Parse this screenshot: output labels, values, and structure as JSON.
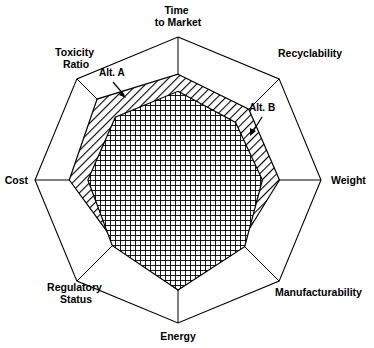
{
  "chart_data": {
    "type": "radar",
    "title": "",
    "subtitle": "",
    "xlabel": "",
    "ylabel": "",
    "grid": true,
    "legend_position": "inline-annotation",
    "axis_max": 1.0,
    "axis_min": 0.0,
    "categories": [
      "Time to Market",
      "Recyclability",
      "Weight",
      "Manufacturability",
      "Energy",
      "Regulatory Status",
      "Cost",
      "Toxicity Ratio"
    ],
    "series": [
      {
        "name": "Alt. A",
        "pattern": "diagonal-hatch",
        "values": [
          0.74,
          0.7,
          0.71,
          0.62,
          0.77,
          0.62,
          0.76,
          0.8
        ]
      },
      {
        "name": "Alt. B",
        "pattern": "cross-hatch",
        "values": [
          0.62,
          0.57,
          0.59,
          0.66,
          0.77,
          0.65,
          0.63,
          0.62
        ]
      }
    ]
  },
  "axes": [
    {
      "id": "time-to-market",
      "label_lines": [
        "Time",
        "to Market"
      ],
      "label": "Time to Market"
    },
    {
      "id": "recyclability",
      "label_lines": [
        "Recyclability"
      ],
      "label": "Recyclability"
    },
    {
      "id": "weight",
      "label_lines": [
        "Weight"
      ],
      "label": "Weight"
    },
    {
      "id": "manufacturability",
      "label_lines": [
        "Manufacturability"
      ],
      "label": "Manufacturability"
    },
    {
      "id": "energy",
      "label_lines": [
        "Energy"
      ],
      "label": "Energy"
    },
    {
      "id": "regulatory-status",
      "label_lines": [
        "Regulatory",
        "Status"
      ],
      "label": "Regulatory Status"
    },
    {
      "id": "cost",
      "label_lines": [
        "Cost"
      ],
      "label": "Cost"
    },
    {
      "id": "toxicity-ratio",
      "label_lines": [
        "Toxicity",
        "Ratio"
      ],
      "label": "Toxicity Ratio"
    }
  ],
  "labels": {
    "time_line1": "Time",
    "time_line2": "to Market",
    "recyclability": "Recyclability",
    "weight": "Weight",
    "manufacturability": "Manufacturability",
    "energy": "Energy",
    "regulatory_line1": "Regulatory",
    "regulatory_line2": "Status",
    "cost": "Cost",
    "toxicity_line1": "Toxicity",
    "toxicity_line2": "Ratio"
  },
  "annotations": {
    "alt_a": "Alt. A",
    "alt_b": "Alt. B"
  },
  "colors": {
    "stroke": "#000000",
    "background": "#ffffff",
    "pattern": "#000000"
  }
}
